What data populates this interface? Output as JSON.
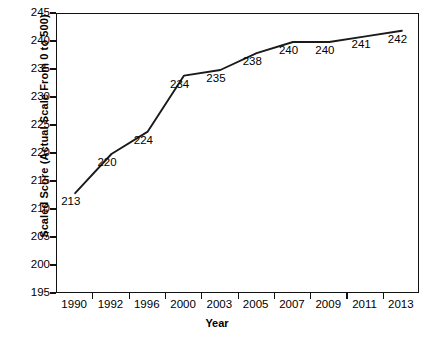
{
  "chart_data": {
    "type": "line",
    "title": "",
    "xlabel": "Year",
    "ylabel": "Scaled Score (Actual Scale From 0 to 500)",
    "categories": [
      "1990",
      "1992",
      "1996",
      "2000",
      "2003",
      "2005",
      "2007",
      "2009",
      "2011",
      "2013"
    ],
    "values": [
      213,
      220,
      224,
      234,
      235,
      238,
      240,
      240,
      241,
      242
    ],
    "point_labels": [
      "213",
      "220",
      "224",
      "234",
      "235",
      "238",
      "240",
      "240",
      "241",
      "242"
    ],
    "ylim": [
      195,
      245
    ],
    "yticks": [
      195,
      200,
      205,
      210,
      215,
      220,
      225,
      230,
      235,
      240,
      245
    ],
    "ytick_labels": [
      "195",
      "200",
      "205",
      "210",
      "215",
      "220",
      "225",
      "230",
      "235",
      "240",
      "245"
    ],
    "grid": false,
    "legend": null,
    "line_color": "#1a1a1a",
    "markers": false,
    "axis_color": "#111111",
    "background": "#ffffff"
  }
}
